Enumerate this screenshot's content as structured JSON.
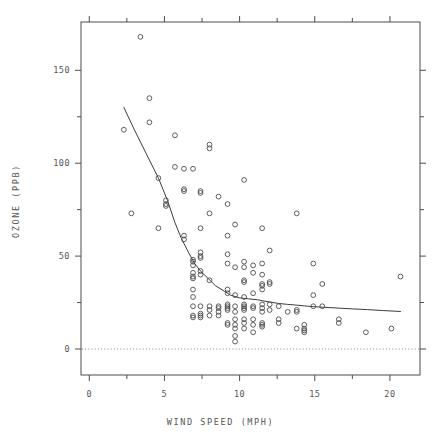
{
  "chart_data": {
    "type": "scatter",
    "title": "",
    "xlabel": "WIND SPEED (MPH)",
    "ylabel": "OZONE (PPB)",
    "xlim": [
      -0.55,
      22.0
    ],
    "ylim": [
      -14,
      176
    ],
    "grid": false,
    "legend": null,
    "x_major_ticks": [
      0,
      5,
      10,
      15,
      20
    ],
    "x_minor_ticks": [
      2.5,
      7.5,
      12.5,
      17.5
    ],
    "x_tick_labels": [
      "0",
      "5",
      "10",
      "15",
      "20"
    ],
    "y_major_ticks": [
      0,
      50,
      100,
      150
    ],
    "y_minor_ticks": [
      25,
      75,
      125
    ],
    "y_tick_labels": [
      "0",
      "50",
      "100",
      "150"
    ],
    "marker": {
      "shape": "open-circle",
      "radius_px": 2.4,
      "stroke": "#4d4d4d",
      "fill": "none",
      "stroke_width": 0.9
    },
    "reference_line": {
      "orientation": "horizontal",
      "y": 0,
      "style": "dotted",
      "color": "#808080"
    },
    "smoother": {
      "name": "lowess",
      "style": "solid",
      "color": "#3c3c3c",
      "width_px": 1.0,
      "points": [
        [
          2.3,
          130.0
        ],
        [
          3.0,
          118.0
        ],
        [
          3.8,
          105.0
        ],
        [
          4.6,
          92.0
        ],
        [
          5.2,
          80.0
        ],
        [
          5.7,
          68.0
        ],
        [
          6.1,
          60.0
        ],
        [
          6.6,
          52.0
        ],
        [
          7.0,
          46.0
        ],
        [
          7.4,
          42.0
        ],
        [
          7.9,
          38.0
        ],
        [
          8.4,
          34.0
        ],
        [
          9.0,
          31.0
        ],
        [
          9.4,
          29.0
        ],
        [
          10.0,
          27.5
        ],
        [
          10.6,
          27.0
        ],
        [
          11.2,
          26.5
        ],
        [
          11.5,
          26.0
        ],
        [
          12.0,
          25.3
        ],
        [
          12.6,
          24.5
        ],
        [
          13.2,
          24.0
        ],
        [
          13.8,
          23.6
        ],
        [
          14.3,
          23.2
        ],
        [
          14.9,
          22.8
        ],
        [
          15.5,
          22.5
        ],
        [
          16.6,
          22.0
        ],
        [
          17.5,
          21.6
        ],
        [
          18.5,
          21.2
        ],
        [
          19.5,
          20.7
        ],
        [
          20.7,
          20.2
        ]
      ]
    },
    "points": [
      [
        2.3,
        118
      ],
      [
        2.8,
        73
      ],
      [
        3.4,
        168
      ],
      [
        4.0,
        135
      ],
      [
        4.0,
        122
      ],
      [
        4.6,
        92
      ],
      [
        4.6,
        65
      ],
      [
        5.1,
        80
      ],
      [
        5.1,
        78
      ],
      [
        5.1,
        77
      ],
      [
        5.7,
        115
      ],
      [
        5.7,
        98
      ],
      [
        6.3,
        97
      ],
      [
        6.3,
        86
      ],
      [
        6.3,
        85
      ],
      [
        6.3,
        61
      ],
      [
        6.3,
        59
      ],
      [
        6.9,
        97
      ],
      [
        6.9,
        48
      ],
      [
        6.9,
        47
      ],
      [
        6.9,
        45
      ],
      [
        6.9,
        41
      ],
      [
        6.9,
        39
      ],
      [
        6.9,
        38
      ],
      [
        6.9,
        32
      ],
      [
        6.9,
        28
      ],
      [
        6.9,
        23
      ],
      [
        6.9,
        18
      ],
      [
        6.9,
        17
      ],
      [
        7.4,
        85
      ],
      [
        7.4,
        84
      ],
      [
        7.4,
        65
      ],
      [
        7.4,
        52
      ],
      [
        7.4,
        50
      ],
      [
        7.4,
        49
      ],
      [
        7.4,
        42
      ],
      [
        7.4,
        40
      ],
      [
        7.4,
        23
      ],
      [
        7.4,
        19
      ],
      [
        7.4,
        18
      ],
      [
        7.4,
        17
      ],
      [
        8.0,
        110
      ],
      [
        8.0,
        108
      ],
      [
        8.0,
        73
      ],
      [
        8.0,
        37
      ],
      [
        8.0,
        23
      ],
      [
        8.0,
        21
      ],
      [
        8.0,
        18
      ],
      [
        8.6,
        82
      ],
      [
        8.6,
        23
      ],
      [
        8.6,
        22
      ],
      [
        8.6,
        20
      ],
      [
        8.6,
        18
      ],
      [
        9.2,
        78
      ],
      [
        9.2,
        61
      ],
      [
        9.2,
        51
      ],
      [
        9.2,
        46
      ],
      [
        9.2,
        32
      ],
      [
        9.2,
        30
      ],
      [
        9.2,
        24
      ],
      [
        9.2,
        23
      ],
      [
        9.2,
        22
      ],
      [
        9.2,
        21
      ],
      [
        9.2,
        14
      ],
      [
        9.2,
        13
      ],
      [
        9.7,
        67
      ],
      [
        9.7,
        44
      ],
      [
        9.7,
        29
      ],
      [
        9.7,
        23
      ],
      [
        9.7,
        20
      ],
      [
        9.7,
        16
      ],
      [
        9.7,
        13
      ],
      [
        9.7,
        11
      ],
      [
        9.7,
        7
      ],
      [
        9.7,
        4
      ],
      [
        10.3,
        91
      ],
      [
        10.3,
        47
      ],
      [
        10.3,
        44
      ],
      [
        10.3,
        37
      ],
      [
        10.3,
        36
      ],
      [
        10.3,
        28
      ],
      [
        10.3,
        24
      ],
      [
        10.3,
        23
      ],
      [
        10.3,
        22
      ],
      [
        10.3,
        21
      ],
      [
        10.3,
        16
      ],
      [
        10.3,
        14
      ],
      [
        10.3,
        11
      ],
      [
        10.9,
        45
      ],
      [
        10.9,
        41
      ],
      [
        10.9,
        30
      ],
      [
        10.9,
        23
      ],
      [
        10.9,
        22
      ],
      [
        10.9,
        16
      ],
      [
        10.9,
        13
      ],
      [
        10.9,
        9
      ],
      [
        11.5,
        65
      ],
      [
        11.5,
        46
      ],
      [
        11.5,
        40
      ],
      [
        11.5,
        35
      ],
      [
        11.5,
        34
      ],
      [
        11.5,
        32
      ],
      [
        11.5,
        24
      ],
      [
        11.5,
        22
      ],
      [
        11.5,
        20
      ],
      [
        11.5,
        14
      ],
      [
        11.5,
        13
      ],
      [
        11.5,
        12
      ],
      [
        12.0,
        53
      ],
      [
        12.0,
        36
      ],
      [
        12.0,
        35
      ],
      [
        12.0,
        24
      ],
      [
        12.0,
        21
      ],
      [
        12.6,
        23
      ],
      [
        12.6,
        16
      ],
      [
        12.6,
        14
      ],
      [
        13.2,
        20
      ],
      [
        13.8,
        73
      ],
      [
        13.8,
        21
      ],
      [
        13.8,
        20
      ],
      [
        13.8,
        11
      ],
      [
        14.3,
        11
      ],
      [
        14.3,
        10
      ],
      [
        14.3,
        9
      ],
      [
        14.3,
        13
      ],
      [
        14.9,
        46
      ],
      [
        14.9,
        29
      ],
      [
        14.9,
        23
      ],
      [
        15.5,
        35
      ],
      [
        15.5,
        23
      ],
      [
        16.6,
        16
      ],
      [
        16.6,
        14
      ],
      [
        18.4,
        9
      ],
      [
        20.1,
        11
      ],
      [
        20.7,
        39
      ]
    ]
  },
  "axes": {
    "x_title": "WIND SPEED (MPH)",
    "y_title": "OZONE (PPB)"
  }
}
